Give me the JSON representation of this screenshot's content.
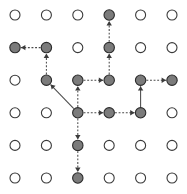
{
  "figure": {
    "name": "grid-graph-traversal",
    "width": 187,
    "height": 194,
    "background_color": "#ffffff"
  },
  "chart_data": {
    "type": "scatter",
    "title": "",
    "subtitle": "",
    "xlabel": "",
    "ylabel": "",
    "grid": false,
    "legend": null,
    "annotations": [],
    "layout": {
      "rows": 6,
      "cols": 6,
      "origin_x": 15,
      "origin_y": 15,
      "step_x": 31.4,
      "step_y": 32.6,
      "node_radius_open": 5.0,
      "node_radius_filled": 5.2
    },
    "styles": {
      "node_open_fill": "#ffffff",
      "node_open_stroke": "#3a3a3a",
      "node_filled_fill": "#7b7b7b",
      "node_filled_stroke": "#2b2b2b",
      "edge_color": "#4a4a4a",
      "arrow_color": "#3b3b3b",
      "edge_dash": "dotted"
    },
    "nodes": [
      {
        "id": "n-0-0",
        "col": 0,
        "row": 0,
        "state": "open"
      },
      {
        "id": "n-1-0",
        "col": 1,
        "row": 0,
        "state": "open"
      },
      {
        "id": "n-2-0",
        "col": 2,
        "row": 0,
        "state": "open"
      },
      {
        "id": "n-3-0",
        "col": 3,
        "row": 0,
        "state": "filled"
      },
      {
        "id": "n-4-0",
        "col": 4,
        "row": 0,
        "state": "open"
      },
      {
        "id": "n-5-0",
        "col": 5,
        "row": 0,
        "state": "open"
      },
      {
        "id": "n-0-1",
        "col": 0,
        "row": 1,
        "state": "filled"
      },
      {
        "id": "n-1-1",
        "col": 1,
        "row": 1,
        "state": "filled"
      },
      {
        "id": "n-2-1",
        "col": 2,
        "row": 1,
        "state": "open"
      },
      {
        "id": "n-3-1",
        "col": 3,
        "row": 1,
        "state": "filled"
      },
      {
        "id": "n-4-1",
        "col": 4,
        "row": 1,
        "state": "open"
      },
      {
        "id": "n-5-1",
        "col": 5,
        "row": 1,
        "state": "open"
      },
      {
        "id": "n-0-2",
        "col": 0,
        "row": 2,
        "state": "open"
      },
      {
        "id": "n-1-2",
        "col": 1,
        "row": 2,
        "state": "filled"
      },
      {
        "id": "n-2-2",
        "col": 2,
        "row": 2,
        "state": "filled"
      },
      {
        "id": "n-3-2",
        "col": 3,
        "row": 2,
        "state": "filled"
      },
      {
        "id": "n-4-2",
        "col": 4,
        "row": 2,
        "state": "filled"
      },
      {
        "id": "n-5-2",
        "col": 5,
        "row": 2,
        "state": "filled"
      },
      {
        "id": "n-0-3",
        "col": 0,
        "row": 3,
        "state": "open"
      },
      {
        "id": "n-1-3",
        "col": 1,
        "row": 3,
        "state": "open"
      },
      {
        "id": "n-2-3",
        "col": 2,
        "row": 3,
        "state": "filled"
      },
      {
        "id": "n-3-3",
        "col": 3,
        "row": 3,
        "state": "filled"
      },
      {
        "id": "n-4-3",
        "col": 4,
        "row": 3,
        "state": "filled"
      },
      {
        "id": "n-5-3",
        "col": 5,
        "row": 3,
        "state": "open"
      },
      {
        "id": "n-0-4",
        "col": 0,
        "row": 4,
        "state": "open"
      },
      {
        "id": "n-1-4",
        "col": 1,
        "row": 4,
        "state": "open"
      },
      {
        "id": "n-2-4",
        "col": 2,
        "row": 4,
        "state": "filled"
      },
      {
        "id": "n-3-4",
        "col": 3,
        "row": 4,
        "state": "open"
      },
      {
        "id": "n-4-4",
        "col": 4,
        "row": 4,
        "state": "open"
      },
      {
        "id": "n-5-4",
        "col": 5,
        "row": 4,
        "state": "open"
      },
      {
        "id": "n-0-5",
        "col": 0,
        "row": 5,
        "state": "open"
      },
      {
        "id": "n-1-5",
        "col": 1,
        "row": 5,
        "state": "open"
      },
      {
        "id": "n-2-5",
        "col": 2,
        "row": 5,
        "state": "filled"
      },
      {
        "id": "n-3-5",
        "col": 3,
        "row": 5,
        "state": "open"
      },
      {
        "id": "n-4-5",
        "col": 4,
        "row": 5,
        "state": "open"
      },
      {
        "id": "n-5-5",
        "col": 5,
        "row": 5,
        "state": "open"
      }
    ],
    "edges": [
      {
        "id": "e-1",
        "from": [
          1,
          1
        ],
        "to": [
          0,
          1
        ],
        "direction": "left",
        "arrow": true,
        "style": "dotted"
      },
      {
        "id": "e-2",
        "from": [
          1,
          2
        ],
        "to": [
          1,
          1
        ],
        "direction": "up",
        "arrow": true,
        "style": "dotted"
      },
      {
        "id": "e-3",
        "from": [
          2,
          3
        ],
        "to": [
          1,
          2
        ],
        "direction": "diagonal-up-left",
        "arrow": true,
        "style": "solid"
      },
      {
        "id": "e-4",
        "from": [
          2,
          2
        ],
        "to": [
          3,
          2
        ],
        "direction": "right",
        "arrow": true,
        "style": "dotted"
      },
      {
        "id": "e-5",
        "from": [
          3,
          2
        ],
        "to": [
          3,
          1
        ],
        "direction": "up",
        "arrow": true,
        "style": "dotted"
      },
      {
        "id": "e-6",
        "from": [
          3,
          1
        ],
        "to": [
          3,
          0
        ],
        "direction": "up",
        "arrow": true,
        "style": "dotted"
      },
      {
        "id": "e-7",
        "from": [
          4,
          2
        ],
        "to": [
          5,
          2
        ],
        "direction": "right",
        "arrow": true,
        "style": "dotted"
      },
      {
        "id": "e-8",
        "from": [
          2,
          3
        ],
        "to": [
          2,
          2
        ],
        "direction": "up",
        "arrow": true,
        "style": "dotted"
      },
      {
        "id": "e-9",
        "from": [
          2,
          3
        ],
        "to": [
          3,
          3
        ],
        "direction": "right",
        "arrow": true,
        "style": "dotted"
      },
      {
        "id": "e-10",
        "from": [
          3,
          3
        ],
        "to": [
          4,
          3
        ],
        "direction": "right",
        "arrow": true,
        "style": "dotted"
      },
      {
        "id": "e-11",
        "from": [
          4,
          3
        ],
        "to": [
          4,
          2
        ],
        "direction": "up",
        "arrow": true,
        "style": "solid"
      },
      {
        "id": "e-12",
        "from": [
          2,
          3
        ],
        "to": [
          2,
          4
        ],
        "direction": "down",
        "arrow": true,
        "style": "dotted"
      },
      {
        "id": "e-13",
        "from": [
          2,
          4
        ],
        "to": [
          2,
          5
        ],
        "direction": "down",
        "arrow": true,
        "style": "dotted"
      }
    ]
  }
}
